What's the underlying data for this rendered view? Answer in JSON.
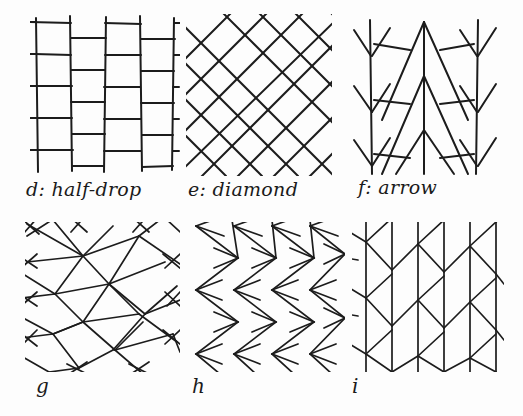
{
  "page": {
    "background_color": "#fdfdfd",
    "ink_color": "#1c1c1c",
    "width": 523,
    "height": 416
  },
  "figures": [
    {
      "id": "d",
      "key": "half-drop",
      "caption": "d: half-drop",
      "label_letter": "d",
      "label_name": "half-drop",
      "type": "rectangular-brick-grid",
      "description": "Vertical lines crossed by short horizontal bars that alternate height column to column, forming offset rectangles",
      "box": {
        "x": 30,
        "y": 14,
        "w": 145,
        "h": 160
      },
      "caption_pos": {
        "x": 26,
        "y": 180
      },
      "columns": 5,
      "rows": 5,
      "drop_offset": 0.5
    },
    {
      "id": "e",
      "key": "diamond",
      "caption": "e: diamond",
      "label_letter": "e",
      "label_name": "diamond",
      "type": "diagonal-lattice",
      "description": "Two families of parallel diagonal lines at plus and minus 45 degrees forming a diamond net",
      "box": {
        "x": 188,
        "y": 14,
        "w": 140,
        "h": 160
      },
      "caption_pos": {
        "x": 188,
        "y": 180
      },
      "diagonals_per_family": 9,
      "angle_degrees": 45
    },
    {
      "id": "f",
      "key": "arrow",
      "caption": "f: arrow",
      "label_letter": "f",
      "label_name": "arrow",
      "type": "arrow-stems-and-chevrons",
      "description": "Straight vertical stems carrying downward arrow barbs, linked by large V chevrons between stems",
      "box": {
        "x": 352,
        "y": 14,
        "w": 140,
        "h": 160
      },
      "caption_pos": {
        "x": 358,
        "y": 178
      },
      "stems": 4,
      "barb_rows": 3
    },
    {
      "id": "g",
      "key": "g",
      "caption": "g",
      "label_letter": "g",
      "label_name": "",
      "type": "flattened-diamond-net",
      "description": "Elongated flattened diamond lattice, half-drop offset, crossings extend past the nodes",
      "box": {
        "x": 25,
        "y": 222,
        "w": 150,
        "h": 148
      },
      "caption_pos": {
        "x": 36,
        "y": 378
      },
      "columns": 3,
      "rows": 4
    },
    {
      "id": "h",
      "key": "h",
      "caption": "h",
      "label_letter": "h",
      "label_name": "",
      "type": "zigzag-columns-with-barbs",
      "description": "Columns of vertical zigzag chevrons pointing right, each node sprouting left-pointing arrow barbs",
      "box": {
        "x": 190,
        "y": 222,
        "w": 150,
        "h": 148
      },
      "caption_pos": {
        "x": 192,
        "y": 378
      },
      "columns": 4,
      "rows": 5
    },
    {
      "id": "i",
      "key": "i",
      "caption": "i",
      "label_letter": "i",
      "label_name": "",
      "type": "herringbone-branches",
      "description": "Parallel vertical lines with chevron branches angling off them in a herringbone repeat",
      "box": {
        "x": 352,
        "y": 222,
        "w": 150,
        "h": 148
      },
      "caption_pos": {
        "x": 352,
        "y": 378
      },
      "verticals": 7,
      "branch_rows": 4
    }
  ]
}
